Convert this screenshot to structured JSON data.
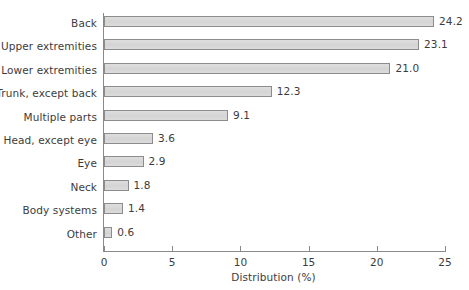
{
  "chart_data": {
    "type": "bar",
    "orientation": "horizontal",
    "title": "",
    "xlabel": "Distribution (%)",
    "ylabel": "",
    "xlim": [
      0,
      25
    ],
    "xticks": [
      0,
      5,
      10,
      15,
      20,
      25
    ],
    "xtick_labels": [
      "0",
      "5",
      "10",
      "15",
      "20",
      "25"
    ],
    "grid": false,
    "legend": null,
    "categories": [
      "Back",
      "Upper extremities",
      "Lower extremities",
      "Trunk, except back",
      "Multiple parts",
      "Head, except eye",
      "Eye",
      "Neck",
      "Body systems",
      "Other"
    ],
    "values": [
      24.2,
      23.1,
      21.0,
      12.3,
      9.1,
      3.6,
      2.9,
      1.8,
      1.4,
      0.6
    ],
    "value_labels": [
      "24.2",
      "23.1",
      "21.0",
      "12.3",
      "9.1",
      "3.6",
      "2.9",
      "1.8",
      "1.4",
      "0.6"
    ],
    "colors": {
      "bar_fill": "#d9d9d9",
      "bar_border": "#8c8c8c",
      "axis": "#8a8a8a",
      "text": "#3c3c3c",
      "background": "#ffffff"
    }
  }
}
